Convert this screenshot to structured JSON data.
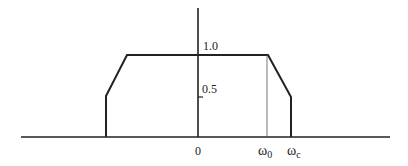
{
  "diagram": {
    "type": "frequency-response-trapezoid",
    "colors": {
      "stroke": "#222222",
      "thin_stroke": "#555555",
      "background": "#ffffff"
    },
    "labels": {
      "y_high": "1.0",
      "y_mid": "0.5",
      "origin": "0",
      "omega0_base": "ω",
      "omega0_sub": "0",
      "omegac_base": "ω",
      "omegac_sub": "c"
    },
    "points": {
      "baseline": {
        "x1": 21,
        "x2": 390,
        "y": 137
      },
      "y_axis": {
        "x": 198,
        "y_top": 8,
        "y_bottom": 137
      },
      "curve": [
        [
          106,
          137
        ],
        [
          106,
          96
        ],
        [
          127,
          55
        ],
        [
          268,
          55
        ],
        [
          291,
          97
        ],
        [
          291,
          137
        ]
      ],
      "omega0_marker": {
        "x": 267,
        "y_top": 55,
        "y_bottom": 137
      },
      "half_tick": {
        "x1": 198,
        "x2": 203,
        "y": 97
      }
    }
  }
}
